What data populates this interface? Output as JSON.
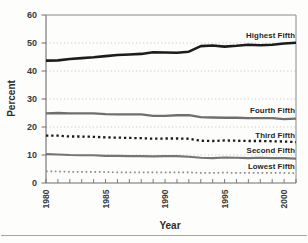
{
  "chart_data": {
    "type": "line",
    "title": "",
    "xlabel": "Year",
    "ylabel": "Percent",
    "xlim": [
      1980,
      2001
    ],
    "ylim": [
      0,
      60
    ],
    "grid": "horizontal-dotted",
    "legend_position": "labels-at-line-ends-right",
    "xtick_labels": [
      "1980",
      "1985",
      "1990",
      "1995",
      "2000"
    ],
    "ytick_labels": [
      "60",
      "50",
      "40",
      "30",
      "20",
      "10",
      "0"
    ],
    "x": [
      1980,
      1981,
      1982,
      1983,
      1984,
      1985,
      1986,
      1987,
      1988,
      1989,
      1990,
      1991,
      1992,
      1993,
      1994,
      1995,
      1996,
      1997,
      1998,
      1999,
      2000,
      2001
    ],
    "series": [
      {
        "name": "Highest Fifth",
        "style": "solid",
        "color": "#1c1c1c",
        "line_width": 2.6,
        "dash": "",
        "values": [
          43.7,
          43.8,
          44.3,
          44.6,
          44.9,
          45.3,
          45.7,
          45.9,
          46.1,
          46.7,
          46.6,
          46.5,
          46.9,
          48.9,
          49.1,
          48.7,
          49.0,
          49.4,
          49.2,
          49.4,
          49.8,
          50.1
        ]
      },
      {
        "name": "Fourth Fifth",
        "style": "solid",
        "color": "#6f6f6f",
        "line_width": 2.3,
        "dash": "",
        "values": [
          24.9,
          25.0,
          24.9,
          24.9,
          24.9,
          24.6,
          24.5,
          24.5,
          24.5,
          24.0,
          24.0,
          24.2,
          24.2,
          23.5,
          23.4,
          23.3,
          23.3,
          23.2,
          23.2,
          23.2,
          22.8,
          23.0
        ]
      },
      {
        "name": "Third Fifth",
        "style": "dotted",
        "color": "#1a1a1a",
        "line_width": 2.3,
        "dash": "2.3 2.9",
        "values": [
          16.9,
          16.9,
          16.6,
          16.6,
          16.5,
          16.3,
          16.2,
          16.1,
          16.0,
          15.8,
          15.9,
          15.9,
          15.8,
          15.1,
          15.0,
          15.2,
          15.1,
          15.0,
          15.0,
          14.9,
          14.8,
          14.6
        ]
      },
      {
        "name": "Second Fifth",
        "style": "solid",
        "color": "#757575",
        "line_width": 2.1,
        "dash": "",
        "values": [
          10.3,
          10.2,
          10.0,
          9.9,
          9.9,
          9.7,
          9.7,
          9.6,
          9.6,
          9.5,
          9.6,
          9.6,
          9.4,
          9.0,
          8.9,
          9.1,
          9.0,
          8.9,
          9.0,
          8.9,
          8.9,
          8.7
        ]
      },
      {
        "name": "Lowest Fifth",
        "style": "dotted",
        "color": "#8d8d8d",
        "line_width": 1.7,
        "dash": "1.7 2.7",
        "values": [
          4.2,
          4.1,
          4.0,
          4.0,
          4.0,
          3.9,
          3.8,
          3.8,
          3.8,
          3.8,
          3.8,
          3.8,
          3.8,
          3.6,
          3.6,
          3.7,
          3.6,
          3.6,
          3.6,
          3.6,
          3.6,
          3.5
        ]
      }
    ],
    "axis_colors": {
      "axis": "#6e6e6e",
      "box": "#8a8a8a",
      "gridline": "#c4c4c4"
    }
  }
}
